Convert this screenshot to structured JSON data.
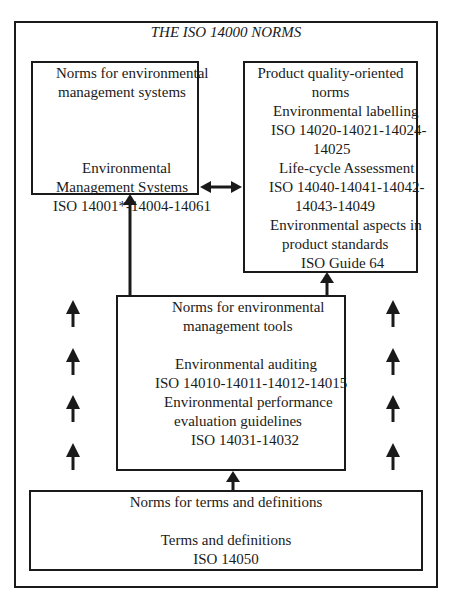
{
  "title": "THE ISO 14000 NORMS",
  "ems_box": {
    "heading": [
      "Norms for environmental",
      "management systems"
    ],
    "lines": [
      "Environmental",
      "Management Systems",
      "ISO 14001*-14004-14061"
    ]
  },
  "product_box": {
    "lines": [
      "Product quality-oriented",
      "norms",
      "Environmental labelling",
      "ISO 14020-14021-14024-",
      "14025",
      "Life-cycle Assessment",
      "ISO 14040-14041-14042-",
      "14043-14049",
      "Environmental aspects in",
      "product standards",
      "ISO Guide 64"
    ]
  },
  "tools_box": {
    "heading": [
      "Norms for environmental",
      "management tools"
    ],
    "lines": [
      "Environmental auditing",
      "ISO 14010-14011-14012-14015",
      "Environmental performance",
      "evaluation guidelines",
      "ISO 14031-14032"
    ]
  },
  "terms_box": {
    "heading": "Norms for terms and definitions",
    "lines": [
      "Terms and definitions",
      "ISO 14050"
    ]
  }
}
